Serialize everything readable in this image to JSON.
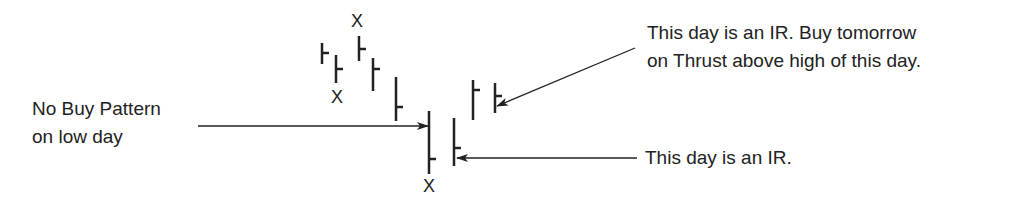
{
  "labels": {
    "left_line1": "No Buy Pattern",
    "left_line2": "on low day",
    "top_right_line1": "This day is an IR. Buy tomorrow",
    "top_right_line2": "on Thrust above high of this day.",
    "bottom_right": "This day is an IR."
  },
  "markers": {
    "x_glyph": "X"
  },
  "colors": {
    "ink": "#222222",
    "background": "#ffffff"
  }
}
